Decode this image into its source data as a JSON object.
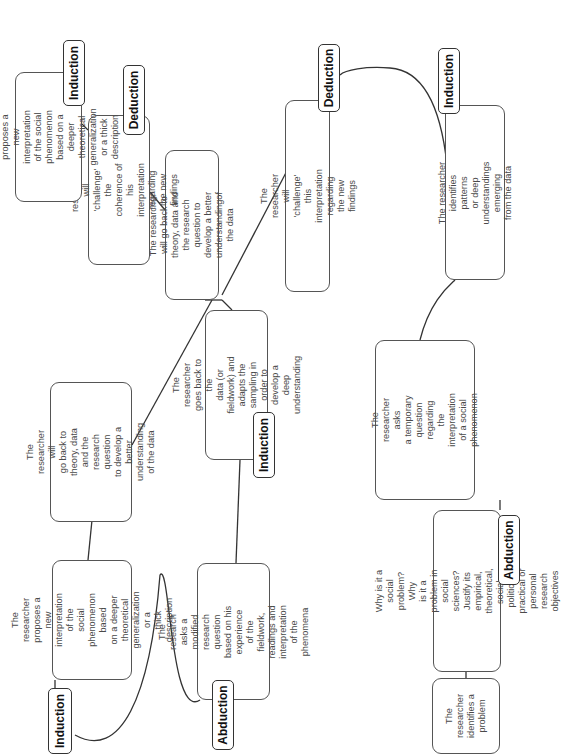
{
  "diagram": {
    "orientation": "rotated 90 degrees counter-clockwise",
    "line_color": "#333333",
    "nodes": {
      "problem": {
        "text": "The researcher\nidentifies a\nproblem"
      },
      "why_social_problem": {
        "text": "Why is it a social problem? Why\nis it a problem in social sciences?\nJustify its empirical, theoretical,\nsocial, political, practical or personal\nresearch objectives"
      },
      "temporary_question": {
        "text": "The researcher asks\na temporary question\nregarding the interpretation\nof a social phenomenon"
      },
      "identifies_patterns": {
        "text": "The researcher identifies patterns\nor deep understandings emerging\nfrom the data"
      },
      "challenge_this": {
        "text": "The researcher will 'challenge' this\ninterpretation regarding the new findings"
      },
      "back_to_theory_upper": {
        "text": "The researcher will go back to\ntheory, data and the research\nquestion to develop a better\nunderstandingof the data"
      },
      "challenge_coherence": {
        "text": "The researcher will 'challenge' the\ncoherence of his interpretation\nregarding the new findings"
      },
      "proposes_upper": {
        "text": "The researcher proposes a new\ninterpretation of the social phenomenon\nbased on a deeper theoretical generalization\nor a thick description"
      },
      "back_to_data": {
        "text": "The researcher goes back to the\ndata (or fieldwork) and adapts the\nsampling in order to\ndevelop a deep understanding"
      },
      "modified_question": {
        "text": "The research asks a modified\nresearch question based on his\nexperience of the fieldwork,\nreadings and interpretation\nof the phenomena"
      },
      "back_to_theory_lower": {
        "text": "The researcher will\ngo back to theory, data\nand the research question\nto develop a better\nunderstanding of the data"
      },
      "proposes_lower": {
        "text": "The researcher proposes a\nnew interpretation of the\nsocial phenomenon based\non a deeper theoretical\ngeneralization or a\nthick description"
      }
    },
    "tags": {
      "abduction_bottom": "Abduction",
      "induction_right": "Induction",
      "deduction_right": "Deduction",
      "deduction_upper": "Deduction",
      "induction_upper": "Induction",
      "induction_mid": "Induction",
      "abduction_lower": "Abduction",
      "induction_lower": "Induction"
    }
  }
}
